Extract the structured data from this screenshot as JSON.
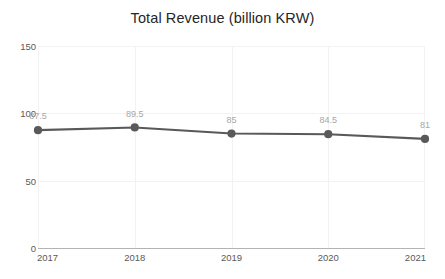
{
  "chart_data": {
    "type": "line",
    "title": "Total Revenue (billion KRW)",
    "xlabel": "",
    "ylabel": "",
    "categories": [
      "2017",
      "2018",
      "2019",
      "2020",
      "2021"
    ],
    "values": [
      87.5,
      89.5,
      85,
      84.5,
      81
    ],
    "point_labels": [
      "87.5",
      "89.5",
      "85",
      "84.5",
      "81"
    ],
    "ylim": [
      0,
      150
    ],
    "yticks": [
      0,
      50,
      100,
      150
    ],
    "ytick_labels": [
      "0",
      "50",
      "100",
      "150"
    ],
    "grid": true,
    "legend": false,
    "series": [
      {
        "name": "Total Revenue",
        "values": [
          87.5,
          89.5,
          85,
          84.5,
          81
        ],
        "line_color": "#595959",
        "marker_color": "#595959",
        "marker": "circle"
      }
    ],
    "colors": {
      "line": "#595959",
      "marker": "#595959",
      "gridline": "#f2f2f2",
      "axis": "#b3b3b3",
      "title_text": "#262626",
      "tick_text": "#595959",
      "data_label_text": "#a6a6a6",
      "background": "#ffffff"
    }
  }
}
